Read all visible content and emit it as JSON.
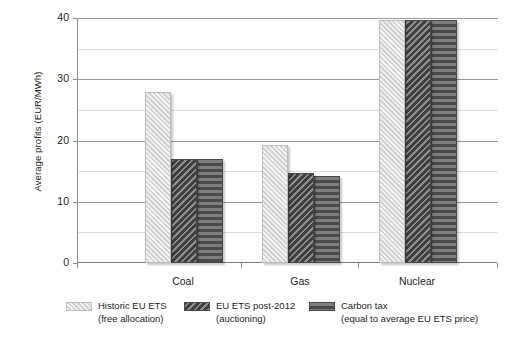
{
  "chart_data": {
    "type": "bar",
    "title": "",
    "xlabel": "",
    "ylabel": "Average profits (EUR/MWh)",
    "categories": [
      "Coal",
      "Gas",
      "Nuclear"
    ],
    "series": [
      {
        "name": "Historic EU ETS (free allocation)",
        "values": [
          28.0,
          19.3,
          39.7
        ]
      },
      {
        "name": "EU ETS post-2012 (auctioning)",
        "values": [
          17.0,
          14.7,
          39.7
        ]
      },
      {
        "name": "Carbon tax (equal to average EU ETS price)",
        "values": [
          17.0,
          14.2,
          39.7
        ]
      }
    ],
    "ylim": [
      0,
      40
    ],
    "yticks": [
      0,
      10,
      20,
      30,
      40
    ],
    "ytick_labels": [
      "0",
      "10",
      "20",
      "30",
      "40"
    ],
    "minor_gridlines": [
      5,
      15,
      25,
      35
    ],
    "grid": true,
    "legend_position": "bottom"
  },
  "legend": {
    "items": [
      {
        "line1": "Historic EU ETS",
        "line2": "(free allocation)",
        "swatch": "hatch-light-swatch"
      },
      {
        "line1": "EU ETS post-2012",
        "line2": "(auctioning)",
        "swatch": "hatch-dark-swatch"
      },
      {
        "line1": "Carbon tax",
        "line2": "(equal to average EU ETS price)",
        "swatch": "stripe-dark-swatch"
      }
    ]
  }
}
